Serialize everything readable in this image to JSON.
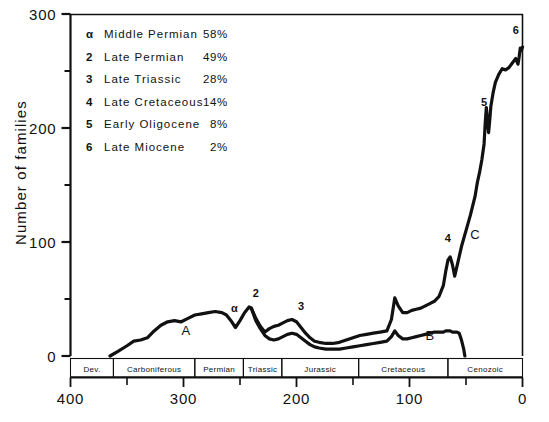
{
  "chart_data": {
    "type": "line",
    "title": "",
    "xlabel": "",
    "ylabel": "Number of families",
    "xlim": [
      400,
      0
    ],
    "ylim": [
      0,
      300
    ],
    "x_ticks": [
      400,
      300,
      200,
      100,
      0
    ],
    "x_minor_ticks": [
      350,
      250,
      150,
      50
    ],
    "y_ticks": [
      0,
      100,
      200,
      300
    ],
    "y_minor_ticks": [
      50,
      150,
      250
    ],
    "grid": false,
    "legend_position": "top-left",
    "axis_direction": "x decreasing (millions of years before present)",
    "series": [
      {
        "name": "upper-curve-total-families",
        "points": [
          [
            365,
            0
          ],
          [
            358,
            4
          ],
          [
            350,
            9
          ],
          [
            344,
            13
          ],
          [
            338,
            14
          ],
          [
            332,
            16
          ],
          [
            326,
            22
          ],
          [
            320,
            27
          ],
          [
            314,
            30
          ],
          [
            308,
            31
          ],
          [
            302,
            30
          ],
          [
            296,
            33
          ],
          [
            290,
            36
          ],
          [
            284,
            37
          ],
          [
            278,
            38
          ],
          [
            272,
            39
          ],
          [
            266,
            38
          ],
          [
            262,
            36
          ],
          [
            258,
            31
          ],
          [
            254,
            25
          ],
          [
            250,
            31
          ],
          [
            246,
            38
          ],
          [
            242,
            43
          ],
          [
            240,
            42
          ],
          [
            236,
            33
          ],
          [
            232,
            26
          ],
          [
            228,
            21
          ],
          [
            224,
            24
          ],
          [
            220,
            26
          ],
          [
            216,
            27
          ],
          [
            212,
            29
          ],
          [
            208,
            31
          ],
          [
            204,
            32
          ],
          [
            200,
            30
          ],
          [
            196,
            25
          ],
          [
            192,
            20
          ],
          [
            188,
            16
          ],
          [
            184,
            13
          ],
          [
            180,
            12
          ],
          [
            174,
            11
          ],
          [
            168,
            11
          ],
          [
            162,
            12
          ],
          [
            156,
            14
          ],
          [
            150,
            16
          ],
          [
            144,
            18
          ],
          [
            138,
            19
          ],
          [
            132,
            20
          ],
          [
            126,
            21
          ],
          [
            120,
            22
          ],
          [
            116,
            32
          ],
          [
            113,
            51
          ],
          [
            110,
            44
          ],
          [
            106,
            38
          ],
          [
            102,
            38
          ],
          [
            98,
            40
          ],
          [
            94,
            41
          ],
          [
            90,
            42
          ],
          [
            86,
            44
          ],
          [
            82,
            46
          ],
          [
            78,
            48
          ],
          [
            74,
            52
          ],
          [
            70,
            62
          ],
          [
            68,
            74
          ],
          [
            66,
            84
          ],
          [
            64,
            87
          ],
          [
            62,
            80
          ],
          [
            60,
            70
          ],
          [
            57,
            83
          ],
          [
            54,
            96
          ],
          [
            50,
            110
          ],
          [
            46,
            124
          ],
          [
            42,
            140
          ],
          [
            40,
            152
          ],
          [
            38,
            161
          ],
          [
            36,
            172
          ],
          [
            34,
            186
          ],
          [
            33,
            204
          ],
          [
            32,
            218
          ],
          [
            31,
            206
          ],
          [
            30,
            196
          ],
          [
            29,
            207
          ],
          [
            28,
            219
          ],
          [
            26,
            231
          ],
          [
            24,
            240
          ],
          [
            21,
            247
          ],
          [
            18,
            252
          ],
          [
            15,
            251
          ],
          [
            12,
            253
          ],
          [
            9,
            257
          ],
          [
            6,
            261
          ],
          [
            4,
            256
          ],
          [
            3,
            262
          ],
          [
            2,
            270
          ],
          [
            1,
            268
          ],
          [
            0,
            271
          ]
        ]
      },
      {
        "name": "lower-curve-subset-families",
        "points": [
          [
            240,
            42
          ],
          [
            236,
            31
          ],
          [
            232,
            24
          ],
          [
            228,
            18
          ],
          [
            224,
            15
          ],
          [
            220,
            14
          ],
          [
            216,
            15
          ],
          [
            212,
            17
          ],
          [
            208,
            19
          ],
          [
            204,
            20
          ],
          [
            200,
            19
          ],
          [
            196,
            16
          ],
          [
            192,
            13
          ],
          [
            188,
            10
          ],
          [
            184,
            8
          ],
          [
            180,
            7
          ],
          [
            174,
            6
          ],
          [
            168,
            6
          ],
          [
            162,
            6
          ],
          [
            156,
            7
          ],
          [
            150,
            8
          ],
          [
            144,
            9
          ],
          [
            138,
            10
          ],
          [
            132,
            11
          ],
          [
            126,
            12
          ],
          [
            120,
            13
          ],
          [
            116,
            17
          ],
          [
            113,
            22
          ],
          [
            110,
            18
          ],
          [
            106,
            15
          ],
          [
            102,
            15
          ],
          [
            98,
            16
          ],
          [
            94,
            17
          ],
          [
            90,
            18
          ],
          [
            86,
            19
          ],
          [
            82,
            20
          ],
          [
            78,
            21
          ],
          [
            74,
            21
          ],
          [
            70,
            21
          ],
          [
            68,
            22
          ],
          [
            66,
            22
          ],
          [
            64,
            22
          ],
          [
            62,
            21
          ],
          [
            60,
            21
          ],
          [
            58,
            21
          ],
          [
            56,
            20
          ],
          [
            54,
            14
          ],
          [
            52,
            6
          ],
          [
            51,
            0
          ]
        ]
      }
    ],
    "event_markers": [
      {
        "symbol": "α",
        "x": 255,
        "y": 34
      },
      {
        "symbol": "2",
        "x": 236,
        "y": 47
      },
      {
        "symbol": "3",
        "x": 196,
        "y": 36
      },
      {
        "symbol": "4",
        "x": 66,
        "y": 96
      },
      {
        "symbol": "5",
        "x": 34,
        "y": 215
      },
      {
        "symbol": "6",
        "x": 6,
        "y": 278
      }
    ],
    "region_labels": [
      {
        "text": "A",
        "x": 298,
        "y": 18
      },
      {
        "text": "B",
        "x": 82,
        "y": 14
      },
      {
        "text": "C",
        "x": 42,
        "y": 103
      }
    ],
    "eras": [
      {
        "label": "Dev.",
        "start": 400,
        "end": 362
      },
      {
        "label": "Carboniferous",
        "start": 362,
        "end": 290
      },
      {
        "label": "Permian",
        "start": 290,
        "end": 247
      },
      {
        "label": "Triassic",
        "start": 247,
        "end": 213
      },
      {
        "label": "Jurassic",
        "start": 213,
        "end": 145
      },
      {
        "label": "Cretaceous",
        "start": 145,
        "end": 66
      },
      {
        "label": "Cenozoic",
        "start": 66,
        "end": 0
      }
    ]
  },
  "legend": {
    "entries": [
      {
        "symbol": "α",
        "name": "Middle  Permian",
        "percent": "58%"
      },
      {
        "symbol": "2",
        "name": "Late  Permian",
        "percent": "49%"
      },
      {
        "symbol": "3",
        "name": "Late  Triassic",
        "percent": "28%"
      },
      {
        "symbol": "4",
        "name": "Late  Cretaceous",
        "percent": "14%"
      },
      {
        "symbol": "5",
        "name": "Early  Oligocene",
        "percent": "8%"
      },
      {
        "symbol": "6",
        "name": "Late  Miocene",
        "percent": "2%"
      }
    ]
  },
  "colors": {
    "ink": "#111111",
    "background": "#ffffff"
  }
}
